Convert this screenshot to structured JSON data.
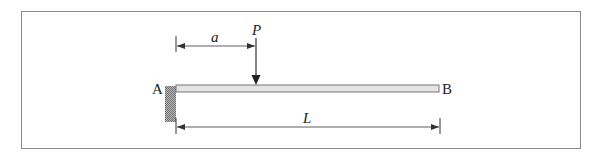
{
  "diagram": {
    "labels": {
      "fixed_end": "A",
      "free_end": "B",
      "load": "P",
      "load_distance": "a",
      "length": "L"
    },
    "colors": {
      "beam_fill": "#e4e4e4",
      "beam_stroke": "#777777",
      "wall_fill": "#a8a8a8",
      "line": "#333333",
      "frame": "#8a8a8a"
    }
  }
}
